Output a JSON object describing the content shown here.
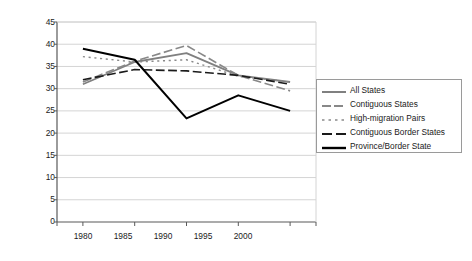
{
  "chart_data": {
    "type": "line",
    "title": "",
    "xlabel": "",
    "ylabel": "Average % Difference in Matched Pairs",
    "categories": [
      "1980",
      "1985",
      "1990",
      "1995",
      "2000"
    ],
    "x": [
      1980,
      1985,
      1990,
      1995,
      2000
    ],
    "xlim": [
      1977.5,
      2002.5
    ],
    "ylim": [
      0,
      45
    ],
    "yticks": [
      "0",
      "5",
      "10",
      "15",
      "20",
      "25",
      "30",
      "35",
      "40",
      "45"
    ],
    "ytick_values": [
      0,
      5,
      10,
      15,
      20,
      25,
      30,
      35,
      40,
      45
    ],
    "grid": "horizontal",
    "legend_position": "right",
    "series": [
      {
        "name": "All States",
        "values": [
          31.0,
          36.0,
          38.0,
          33.0,
          31.5
        ],
        "color": "#808080",
        "style": "solid",
        "width": 1.8
      },
      {
        "name": "Contiguous States",
        "values": [
          31.5,
          36.2,
          39.7,
          33.0,
          29.5
        ],
        "color": "#888888",
        "style": "dashed",
        "width": 1.6
      },
      {
        "name": "High-migration Pairs",
        "values": [
          37.2,
          36.0,
          36.5,
          32.8,
          31.5
        ],
        "color": "#8a8a8a",
        "style": "dotted",
        "width": 1.4
      },
      {
        "name": "Contiguous Border States",
        "values": [
          32.0,
          34.3,
          34.0,
          33.0,
          31.0
        ],
        "color": "#1a1a1a",
        "style": "dashed",
        "width": 1.6
      },
      {
        "name": "Province/Border State",
        "values": [
          39.0,
          36.5,
          23.3,
          28.5,
          25.0
        ],
        "color": "#000000",
        "style": "solid",
        "width": 2.0
      }
    ]
  },
  "legend": {
    "items": [
      {
        "label": "All States"
      },
      {
        "label": "Contiguous States"
      },
      {
        "label": "High-migration Pairs"
      },
      {
        "label": "Contiguous Border States"
      },
      {
        "label": "Province/Border State"
      }
    ]
  },
  "colors": {
    "axis": "#595959",
    "grid": "#d4d4d4",
    "text": "#1a1a1a",
    "background": "#ffffff"
  }
}
